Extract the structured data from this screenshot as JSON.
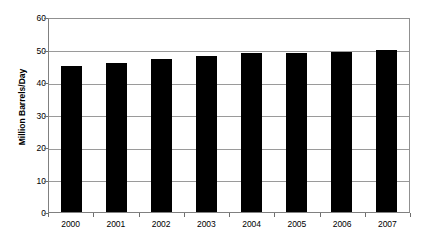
{
  "chart_data": {
    "type": "bar",
    "title": "",
    "subtitle": "",
    "xlabel": "",
    "ylabel": "Million Barrels/Day",
    "categories": [
      "2000",
      "2001",
      "2002",
      "2003",
      "2004",
      "2005",
      "2006",
      "2007"
    ],
    "values": [
      45,
      45.7,
      47,
      48,
      49,
      49,
      49.3,
      50
    ],
    "series": [
      {
        "name": "World Oil Demand",
        "values": [
          45,
          45.7,
          47,
          48,
          49,
          49,
          49.3,
          50
        ]
      }
    ],
    "ylim": [
      0,
      60
    ],
    "yticks": [
      0,
      10,
      20,
      30,
      40,
      50,
      60
    ],
    "ytick_labels": [
      "0",
      "10",
      "20",
      "30",
      "40",
      "50",
      "60"
    ],
    "xlim": null,
    "grid": "horizontal",
    "legend": null,
    "legend_position": "none",
    "annotations": [],
    "bar_color": "#000000",
    "gridline_color": "#9a9a9a",
    "axis_color": "#808080",
    "background_color": "#ffffff"
  }
}
